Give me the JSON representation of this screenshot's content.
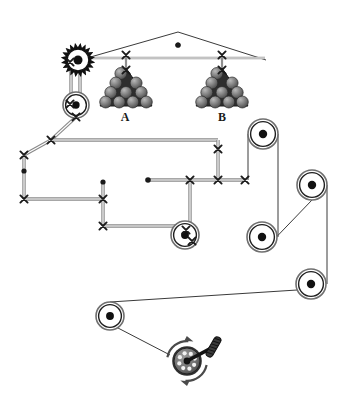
{
  "diagram": {
    "background_color": "#ffffff",
    "line_color": "#3a3a3a",
    "rope_color": "#8a8a8a",
    "marker_color": "#1a1a1a",
    "ball_color": "#6e6e6e",
    "labels": [
      {
        "name": "load-a-label",
        "text": "A",
        "x": 125,
        "y": 121
      },
      {
        "name": "load-b-label",
        "text": "B",
        "x": 222,
        "y": 121
      }
    ],
    "components": {
      "gear": {
        "name": "gear-wheel",
        "cx": 78,
        "cy": 60,
        "r_outer": 17,
        "r_body": 13,
        "r_hub": 4.5,
        "teeth": 20
      },
      "pulleys": [
        {
          "name": "pulley-upper-left",
          "cx": 76,
          "cy": 105,
          "r": 13
        },
        {
          "name": "pulley-middle",
          "cx": 185,
          "cy": 235,
          "r": 14
        },
        {
          "name": "pulley-right-top",
          "cx": 263,
          "cy": 134,
          "r": 15
        },
        {
          "name": "pulley-right-upper",
          "cx": 312,
          "cy": 185,
          "r": 15
        },
        {
          "name": "pulley-right-lower",
          "cx": 262,
          "cy": 237,
          "r": 15
        },
        {
          "name": "pulley-right-bottom",
          "cx": 311,
          "cy": 284,
          "r": 15
        },
        {
          "name": "pulley-bottom-left",
          "cx": 110,
          "cy": 316,
          "r": 14
        }
      ],
      "winch": {
        "name": "winch-crank",
        "cx": 187,
        "cy": 361,
        "r_outer": 20,
        "r_drum": 13,
        "handle_angle": 28,
        "pin_count": 8
      },
      "roof": {
        "name": "roof-truss",
        "apex_x": 178,
        "apex_y": 32,
        "left_x": 80,
        "left_y": 60,
        "right_x": 266,
        "right_y": 60,
        "beam_y": 58,
        "beam_x1": 80,
        "beam_x2": 265,
        "center_dot_x": 178,
        "center_dot_y": 45
      },
      "loads": [
        {
          "name": "load-a",
          "apex_x": 126,
          "apex_y": 68,
          "base_y": 106,
          "half_width": 26,
          "hanger_top_y": 55,
          "rows": 4
        },
        {
          "name": "load-b",
          "apex_x": 222,
          "apex_y": 68,
          "base_y": 106,
          "half_width": 26,
          "hanger_top_y": 55,
          "rows": 4
        }
      ],
      "x_markers": [
        {
          "name": "x-marker-gear",
          "x": 70,
          "y": 62
        },
        {
          "name": "x-marker-pulley-top",
          "x": 70,
          "y": 104
        },
        {
          "name": "x-marker-pulley-bottom",
          "x": 76,
          "y": 117
        },
        {
          "name": "x-marker-beam-a",
          "x": 126,
          "y": 55
        },
        {
          "name": "x-marker-beam-b",
          "x": 222,
          "y": 55
        },
        {
          "name": "x-marker-load-a",
          "x": 126,
          "y": 70
        },
        {
          "name": "x-marker-load-b",
          "x": 222,
          "y": 70
        },
        {
          "name": "x-marker-bend-top",
          "x": 51,
          "y": 140
        },
        {
          "name": "x-marker-left-upper",
          "x": 24,
          "y": 155
        },
        {
          "name": "x-marker-left-lower",
          "x": 24,
          "y": 199
        },
        {
          "name": "x-marker-mid-left",
          "x": 103,
          "y": 199
        },
        {
          "name": "x-marker-mid-low",
          "x": 103,
          "y": 226
        },
        {
          "name": "x-marker-rope-1",
          "x": 190,
          "y": 180
        },
        {
          "name": "x-marker-rope-2",
          "x": 218,
          "y": 180
        },
        {
          "name": "x-marker-rope-3",
          "x": 245,
          "y": 180
        },
        {
          "name": "x-marker-beam-right",
          "x": 218,
          "y": 149
        },
        {
          "name": "x-marker-pulley-mid",
          "x": 186,
          "y": 230
        },
        {
          "name": "x-marker-pulley-mid-2",
          "x": 192,
          "y": 241
        }
      ],
      "dots": [
        {
          "name": "dot-roof-center",
          "x": 178,
          "y": 45,
          "r": 2.6
        },
        {
          "name": "dot-left-rope",
          "x": 24,
          "y": 171,
          "r": 2.6
        },
        {
          "name": "dot-mid-vert",
          "x": 103,
          "y": 182,
          "r": 2.6
        },
        {
          "name": "dot-rope-end",
          "x": 148,
          "y": 180,
          "r": 2.8
        }
      ],
      "ropes": [
        {
          "name": "rope-gear-to-pulley-left",
          "points": "71,62 71,104"
        },
        {
          "name": "rope-gear-to-pulley-right",
          "points": "80,62 80,104"
        },
        {
          "name": "rope-pulley-to-bend",
          "points": "76,117 51,140"
        },
        {
          "name": "rope-bend-to-left-upper",
          "points": "51,140 24,155"
        },
        {
          "name": "rope-left-upper-vertical",
          "points": "24,155 24,199"
        },
        {
          "name": "rope-left-lower-horizontal",
          "points": "24,199 103,199"
        },
        {
          "name": "rope-bend-to-right",
          "points": "51,140 218,140"
        },
        {
          "name": "rope-right-beam-vertical",
          "points": "218,140 218,180"
        },
        {
          "name": "rope-mid-vertical",
          "points": "103,182 103,226"
        },
        {
          "name": "rope-mid-to-pulley",
          "points": "103,226 185,226"
        },
        {
          "name": "rope-dot-to-markers",
          "points": "148,180 245,180"
        },
        {
          "name": "rope-pulley-mid-vertical",
          "points": "190,180 190,241"
        },
        {
          "name": "rope-marker3-to-pulley",
          "points": "245,180 245,180"
        }
      ],
      "belts": [
        {
          "name": "belt-righttop-to-rightlower",
          "points": "248,134 248,180"
        },
        {
          "name": "belt-righttop-right",
          "points": "278,134 278,237"
        },
        {
          "name": "belt-rightlower-to-upper",
          "points": "262,252 312,200"
        },
        {
          "name": "belt-upper-to-bottom",
          "points": "327,185 327,284"
        },
        {
          "name": "belt-bottom-to-bottomleft",
          "points": "297,290 110,302"
        },
        {
          "name": "belt-bottomleft-to-winch",
          "points": "118,328 170,355"
        }
      ]
    }
  }
}
